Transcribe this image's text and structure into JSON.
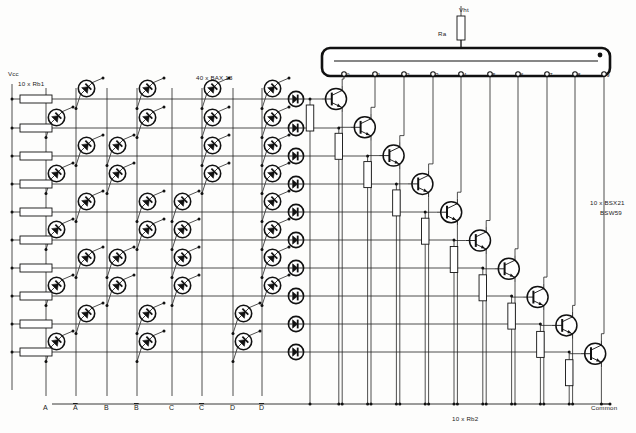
{
  "diagram": {
    "type": "schematic"
  },
  "supplies": {
    "vcc_label": "Vcc",
    "vht_label": "Vht",
    "common_label": "Common"
  },
  "components": {
    "rb1_label": "10 x Rb1",
    "rb2_label": "10 x Rb2",
    "ra_label": "Ra",
    "diode_matrix_label": "40 x BAX 13",
    "transistor_label_line1": "10 x BSX21",
    "transistor_label_line2": "BSW59"
  },
  "inputs": {
    "columns": [
      {
        "name": "A",
        "overline": false,
        "x": 46
      },
      {
        "name": "A",
        "overline": true,
        "x": 76
      },
      {
        "name": "B",
        "overline": false,
        "x": 107
      },
      {
        "name": "B",
        "overline": true,
        "x": 137
      },
      {
        "name": "C",
        "overline": false,
        "x": 172
      },
      {
        "name": "C",
        "overline": true,
        "x": 202
      },
      {
        "name": "D",
        "overline": false,
        "x": 233
      },
      {
        "name": "D",
        "overline": true,
        "x": 262
      }
    ]
  },
  "nixie": {
    "cathode_labels": [
      "0",
      "1",
      "2",
      "3",
      "4",
      "5",
      "6",
      "7",
      "8",
      "9"
    ],
    "anode_dot": true
  },
  "chart_data": {
    "type": "table",
    "categories": [
      "A",
      "A-bar",
      "B",
      "B-bar",
      "C",
      "C-bar",
      "D",
      "D-bar"
    ],
    "rows": [
      {
        "decimal": 0,
        "connect": [
          1,
          3,
          5,
          7
        ]
      },
      {
        "decimal": 1,
        "connect": [
          0,
          3,
          5,
          7
        ]
      },
      {
        "decimal": 2,
        "connect": [
          1,
          2,
          5,
          7
        ]
      },
      {
        "decimal": 3,
        "connect": [
          0,
          2,
          5,
          7
        ]
      },
      {
        "decimal": 4,
        "connect": [
          1,
          3,
          4,
          7
        ]
      },
      {
        "decimal": 5,
        "connect": [
          0,
          3,
          4,
          7
        ]
      },
      {
        "decimal": 6,
        "connect": [
          1,
          2,
          4,
          7
        ]
      },
      {
        "decimal": 7,
        "connect": [
          0,
          2,
          4,
          7
        ]
      },
      {
        "decimal": 8,
        "connect": [
          1,
          3,
          6
        ]
      },
      {
        "decimal": 9,
        "connect": [
          0,
          3,
          6
        ]
      }
    ],
    "ylabel": "decimal output row",
    "xlabel": "BCD input column"
  },
  "rows_y": [
    99,
    128,
    156,
    184,
    212,
    240,
    268,
    296,
    324,
    352
  ],
  "cathode_x": [
    344,
    375,
    404,
    433,
    461,
    490,
    518,
    547,
    575,
    604
  ]
}
